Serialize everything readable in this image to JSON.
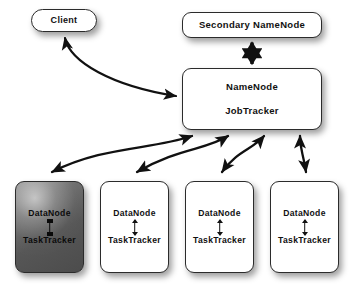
{
  "diagram": {
    "background_color": "#ffffff",
    "stroke_color": "#2b2b2b",
    "text_color": "#111111",
    "highlight_fill": "#5a5a5a"
  },
  "nodes": {
    "client": {
      "label": "Client",
      "shape": "pill"
    },
    "secondary_namenode": {
      "label": "Secondary NameNode",
      "shape": "rounded-rect"
    },
    "master": {
      "line1": "NameNode",
      "line2": "JobTracker",
      "shape": "rounded-rect"
    },
    "datanodes": [
      {
        "line1": "DataNode",
        "line2": "TaskTracker",
        "highlighted": true
      },
      {
        "line1": "DataNode",
        "line2": "TaskTracker",
        "highlighted": false
      },
      {
        "line1": "DataNode",
        "line2": "TaskTracker",
        "highlighted": false
      },
      {
        "line1": "DataNode",
        "line2": "TaskTracker",
        "highlighted": false
      }
    ]
  },
  "edges": [
    {
      "name": "client-to-master",
      "from": "client",
      "to": "master",
      "style": "curved",
      "arrowheads": "both"
    },
    {
      "name": "master-to-secondary",
      "from": "master",
      "to": "secondary_namenode",
      "style": "straight",
      "arrowheads": "both"
    },
    {
      "name": "master-to-datanode-0",
      "from": "master",
      "to": "datanode-0",
      "style": "curved",
      "arrowheads": "both"
    },
    {
      "name": "master-to-datanode-1",
      "from": "master",
      "to": "datanode-1",
      "style": "curved",
      "arrowheads": "both"
    },
    {
      "name": "master-to-datanode-2",
      "from": "master",
      "to": "datanode-2",
      "style": "curved",
      "arrowheads": "both"
    },
    {
      "name": "master-to-datanode-3",
      "from": "master",
      "to": "datanode-3",
      "style": "curved",
      "arrowheads": "both"
    }
  ]
}
